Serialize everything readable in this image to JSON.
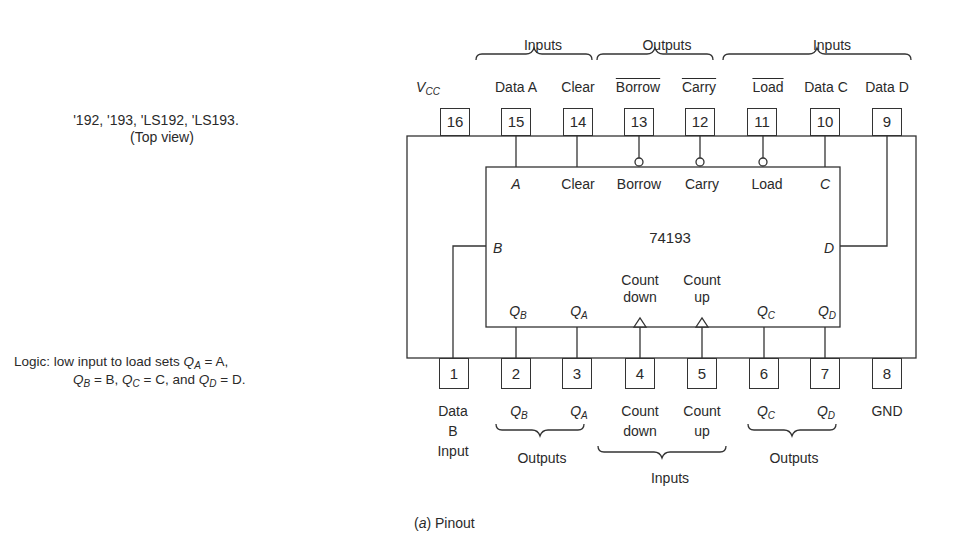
{
  "left_notes": {
    "parts_line": "'192, '193, 'LS192, 'LS193.",
    "view_line": "(Top view)",
    "logic_line1_prefix": "Logic:  low input to load sets ",
    "logic_line1_q": "Q",
    "logic_line1_sub": "A",
    "logic_line1_suffix": " = A,",
    "logic_line2": {
      "q1": "Q",
      "s1": "B",
      "t1": " = B, ",
      "q2": "Q",
      "s2": "C",
      "t2": " = C, and ",
      "q3": "Q",
      "s3": "D",
      "t3": " = D."
    }
  },
  "chip": {
    "name": "74193",
    "internal_top": [
      "A",
      "Clear",
      "Borrow",
      "Carry",
      "Load",
      "C"
    ],
    "internal_left": "B",
    "internal_right": "D",
    "internal_bottom": {
      "qb": {
        "q": "Q",
        "sub": "B"
      },
      "qa": {
        "q": "Q",
        "sub": "A"
      },
      "count_down": [
        "Count",
        "down"
      ],
      "count_up": [
        "Count",
        "up"
      ],
      "qc": {
        "q": "Q",
        "sub": "C"
      },
      "qd": {
        "q": "Q",
        "sub": "D"
      }
    }
  },
  "top_pins": {
    "numbers": [
      "16",
      "15",
      "14",
      "13",
      "12",
      "11",
      "10",
      "9"
    ],
    "labels": {
      "vcc_v": "V",
      "vcc_sub": "CC",
      "p15": "Data A",
      "p14": "Clear",
      "p13": "Borrow",
      "p12": "Carry",
      "p11": "Load",
      "p10": "Data C",
      "p9": "Data D"
    },
    "groups": [
      "Inputs",
      "Outputs",
      "Inputs"
    ]
  },
  "bottom_pins": {
    "numbers": [
      "1",
      "2",
      "3",
      "4",
      "5",
      "6",
      "7",
      "8"
    ],
    "labels": {
      "p1": [
        "Data",
        "B",
        "Input"
      ],
      "p2": {
        "q": "Q",
        "sub": "B"
      },
      "p3": {
        "q": "Q",
        "sub": "A"
      },
      "p4": [
        "Count",
        "down"
      ],
      "p5": [
        "Count",
        "up"
      ],
      "p6": {
        "q": "Q",
        "sub": "C"
      },
      "p7": {
        "q": "Q",
        "sub": "D"
      },
      "p8": "GND"
    },
    "groups": [
      "Outputs",
      "Inputs",
      "Outputs"
    ]
  },
  "caption": {
    "letter": "a",
    "text": " Pinout"
  }
}
